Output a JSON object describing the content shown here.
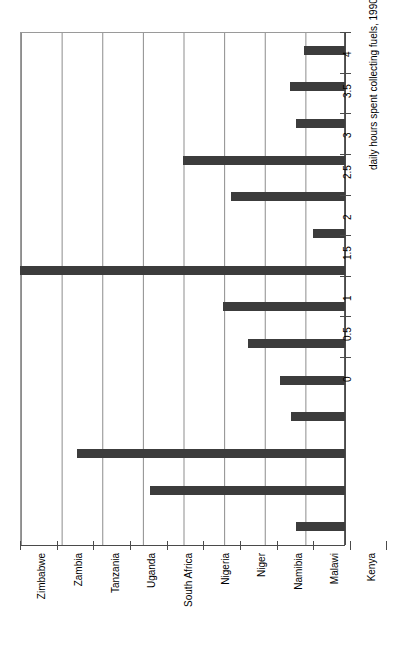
{
  "chart_data": {
    "type": "bar",
    "orientation": "rotated-vertical",
    "title": "",
    "subtitle": "",
    "xlabel": "",
    "ylabel": "daily hours spent collecting fuels, 1990-2003",
    "ylim": [
      0,
      4
    ],
    "ytick_step": 0.5,
    "grid": true,
    "legend": null,
    "categories": [
      "Zimbabwe",
      "Zambia",
      "Tanzania",
      "Uganda",
      "South Africa",
      "Nigeria",
      "Niger",
      "Namibia",
      "Malawi",
      "Kenya",
      "Ghana",
      "Ethiopia",
      "Burkina Faso",
      "Botswana"
    ],
    "values": [
      0.5,
      0.68,
      0.6,
      2.0,
      1.4,
      0.4,
      4.0,
      1.5,
      1.2,
      0.8,
      0.67,
      3.3,
      2.4,
      0.6
    ],
    "tick_labels": [
      "0",
      "0.5",
      "1",
      "1.5",
      "2",
      "2.5",
      "3",
      "3.5",
      "4"
    ],
    "tick_values": [
      0,
      0.5,
      1,
      1.5,
      2,
      2.5,
      3,
      3.5,
      4
    ],
    "bar_color": "#3c3c3c",
    "grid_color": "#8d8d8d",
    "axis_color": "#4a4a4a",
    "background_color": "#ffffff"
  }
}
